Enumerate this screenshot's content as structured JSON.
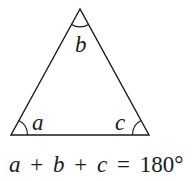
{
  "diagram": {
    "shape": "triangle",
    "angles": [
      {
        "vertex": "bottom-left",
        "label": "a"
      },
      {
        "vertex": "top",
        "label": "b"
      },
      {
        "vertex": "bottom-right",
        "label": "c"
      }
    ],
    "equation": {
      "v1": "a",
      "op1": "+",
      "v2": "b",
      "op2": "+",
      "v3": "c",
      "eq": "=",
      "value": "180°",
      "full": "a + b + c = 180°"
    },
    "colors": {
      "stroke": "#1a1a1a",
      "background": "#ffffff"
    }
  }
}
